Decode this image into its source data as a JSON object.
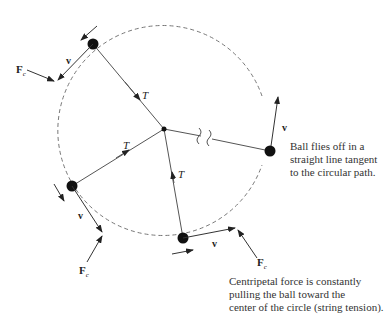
{
  "diagram": {
    "colors": {
      "line": "#444444",
      "ball": "#111111",
      "path": "#777777",
      "text": "#333333"
    },
    "labels": {
      "tension": "T",
      "force": "F",
      "force_sub": "c",
      "velocity": "v"
    },
    "annotations": {
      "fly_off": [
        "Ball flies off in a",
        "straight line tangent",
        "to the circular path."
      ],
      "centripetal": [
        "Centripetal force is constantly",
        "pulling the ball toward the",
        "center of the circle (string tension)."
      ]
    },
    "elements": {
      "center": {
        "x": 164,
        "y": 129
      },
      "path_radius": 105,
      "balls": [
        {
          "name": "top-left",
          "x": 93,
          "y": 44
        },
        {
          "name": "left",
          "x": 72,
          "y": 186
        },
        {
          "name": "bottom",
          "x": 183,
          "y": 238
        },
        {
          "name": "right-released",
          "x": 270,
          "y": 151
        }
      ]
    }
  }
}
